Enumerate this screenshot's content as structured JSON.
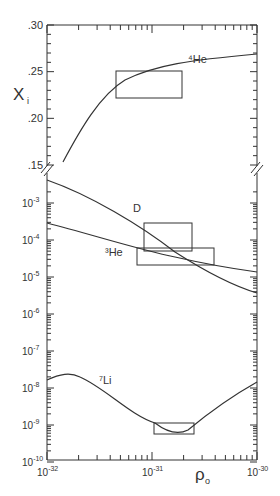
{
  "chart_data": {
    "type": "line",
    "title": "",
    "xlabel": "ρ₀",
    "ylabel": "Xᵢ",
    "x_scale": "log",
    "xlim": [
      1e-32,
      1e-30
    ],
    "x_tick_labels": [
      "10⁻³²",
      "10⁻³¹",
      "10⁻³⁰"
    ],
    "panels": [
      {
        "name": "upper",
        "y_scale": "linear",
        "ylim": [
          0.15,
          0.3
        ],
        "y_tick_labels": [
          ".30",
          ".25",
          ".20",
          ".15"
        ],
        "series": [
          {
            "name": "⁴He",
            "x": [
              1.2e-32,
              2e-32,
              5e-32,
              1e-31,
              2e-31,
              5e-31,
              1e-30
            ],
            "values": [
              0.152,
              0.185,
              0.222,
              0.238,
              0.25,
              0.26,
              0.267
            ]
          }
        ],
        "boxes": [
          {
            "label": "⁴He constraint",
            "x": [
              5e-32,
              2e-31
            ],
            "y": [
              0.221,
              0.25
            ]
          }
        ]
      },
      {
        "name": "lower",
        "y_scale": "log",
        "ylim": [
          1e-10,
          0.002
        ],
        "y_tick_labels": [
          "10⁻³",
          "10⁻⁴",
          "10⁻⁵",
          "10⁻⁶",
          "10⁻⁷",
          "10⁻⁸",
          "10⁻⁹",
          "10⁻¹⁰"
        ],
        "series": [
          {
            "name": "D",
            "x": [
              1e-32,
              3e-32,
              1e-31,
              2e-31,
              4e-31,
              1e-30
            ],
            "values": [
              0.0015,
              0.0006,
              0.00013,
              5e-05,
              1.8e-05,
              3.5e-06
            ]
          },
          {
            "name": "³He",
            "x": [
              1e-32,
              3e-32,
              1e-31,
              2e-31,
              4e-31,
              1e-30
            ],
            "values": [
              0.00028,
              0.00013,
              5.5e-05,
              3.5e-05,
              2.2e-05,
              1.2e-05
            ]
          },
          {
            "name": "⁷Li",
            "x": [
              1e-32,
              1.7e-32,
              3e-32,
              6e-32,
              1.1e-31,
              1.7e-31,
              2.5e-31,
              5e-31,
              1e-30
            ],
            "values": [
              1.3e-08,
              1.7e-08,
              1.2e-08,
              3.5e-09,
              1e-09,
              5.5e-10,
              1e-09,
              4.5e-09,
              1.4e-08
            ]
          }
        ],
        "boxes": [
          {
            "label": "D constraint",
            "x": [
              8.5e-32,
              2e-31
            ],
            "y": [
              5e-05,
              0.0003
            ]
          },
          {
            "label": "³He constraint",
            "x": [
              7.5e-32,
              4.2e-31
            ],
            "y": [
              2e-05,
              6e-05
            ]
          },
          {
            "label": "⁷Li constraint",
            "x": [
              1.1e-31,
              2.6e-31
            ],
            "y": [
              5e-10,
              1e-09
            ]
          }
        ]
      }
    ],
    "annotations": [
      "⁴He",
      "D",
      "³He",
      "⁷Li"
    ],
    "grid": false,
    "legend": "none (inline curve labels)"
  },
  "labels": {
    "ylabel": "X",
    "ylabel_sub": "i",
    "xlabel": "ρ",
    "xlabel_sub": "o",
    "he4": "⁴He",
    "d": "D",
    "he3": "³He",
    "li7": "⁷Li",
    "upper_ticks": [
      ".30",
      ".25",
      ".20",
      ".15"
    ],
    "lower_ticks": [
      "10",
      "10",
      "10",
      "10",
      "10",
      "10",
      "10",
      "10"
    ],
    "lower_exps": [
      "-3",
      "-4",
      "-5",
      "-6",
      "-7",
      "-8",
      "-9",
      "-10"
    ],
    "x_ticks": [
      "10",
      "10",
      "10"
    ],
    "x_exps": [
      "-32",
      "-31",
      "-30"
    ]
  }
}
